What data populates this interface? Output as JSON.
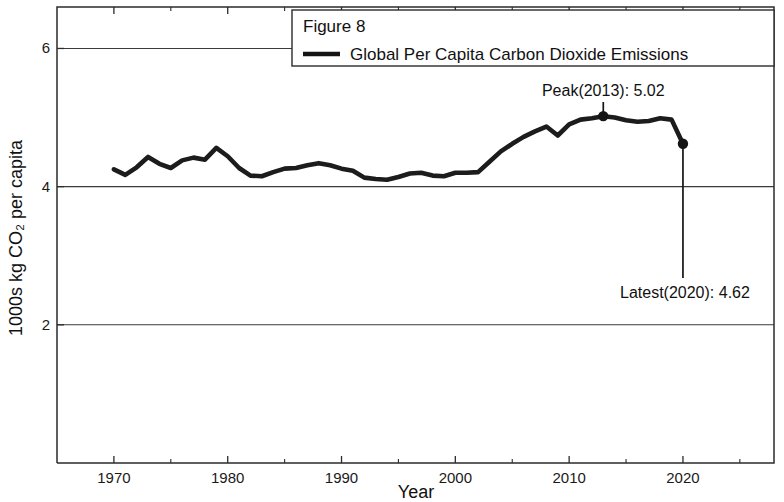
{
  "chart_data": {
    "type": "line",
    "title": "",
    "figure_label": "Figure 8",
    "xlabel": "Year",
    "ylabel": "1000s kg CO₂ per capita",
    "legend": [
      "Global Per Capita Carbon Dioxide Emissions"
    ],
    "legend_position": "top-right",
    "grid": true,
    "xlim": [
      1965,
      2028
    ],
    "ylim": [
      0,
      6.6
    ],
    "xticks": [
      1970,
      1980,
      1990,
      2000,
      2010,
      2020
    ],
    "xtick_labels": [
      "1970",
      "1980",
      "1990",
      "2000",
      "2010",
      "2020"
    ],
    "xminor_ticks": [
      1975,
      1985,
      1995,
      2005,
      2015,
      2025
    ],
    "yticks": [
      2,
      4,
      6
    ],
    "ytick_labels": [
      "2",
      "4",
      "6"
    ],
    "series": [
      {
        "name": "Global Per Capita Carbon Dioxide Emissions",
        "color": "#1c1c1c",
        "x": [
          1970,
          1971,
          1972,
          1973,
          1974,
          1975,
          1976,
          1977,
          1978,
          1979,
          1980,
          1981,
          1982,
          1983,
          1984,
          1985,
          1986,
          1987,
          1988,
          1989,
          1990,
          1991,
          1992,
          1993,
          1994,
          1995,
          1996,
          1997,
          1998,
          1999,
          2000,
          2001,
          2002,
          2003,
          2004,
          2005,
          2006,
          2007,
          2008,
          2009,
          2010,
          2011,
          2012,
          2013,
          2014,
          2015,
          2016,
          2017,
          2018,
          2019,
          2020
        ],
        "values": [
          4.25,
          4.17,
          4.28,
          4.43,
          4.33,
          4.27,
          4.38,
          4.42,
          4.39,
          4.56,
          4.44,
          4.27,
          4.16,
          4.15,
          4.21,
          4.26,
          4.27,
          4.31,
          4.34,
          4.31,
          4.26,
          4.23,
          4.13,
          4.11,
          4.1,
          4.14,
          4.19,
          4.2,
          4.16,
          4.15,
          4.2,
          4.2,
          4.21,
          4.36,
          4.51,
          4.62,
          4.72,
          4.8,
          4.87,
          4.74,
          4.9,
          4.97,
          4.99,
          5.02,
          5.0,
          4.96,
          4.94,
          4.95,
          4.99,
          4.97,
          4.62
        ]
      }
    ],
    "annotations": [
      {
        "name": "peak",
        "label": "Peak(2013): 5.02",
        "x": 2013,
        "y": 5.02
      },
      {
        "name": "latest",
        "label": "Latest(2020): 4.62",
        "x": 2020,
        "y": 4.62
      }
    ]
  }
}
